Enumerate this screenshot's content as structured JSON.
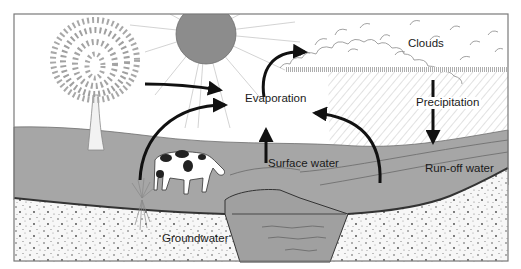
{
  "diagram": {
    "labels": {
      "clouds": "Clouds",
      "evaporation": "Evaporation",
      "precipitation": "Precipitation",
      "surface_water": "Surface water",
      "runoff_water": "Run-off water",
      "groundwater": "Groundwater"
    },
    "elements": [
      "sun",
      "tree",
      "cow",
      "grass",
      "clouds",
      "rain",
      "lake",
      "ground",
      "arrows"
    ],
    "colors": {
      "land": "#a6a6a6",
      "sun": "#8c8c8c",
      "soil": "#f7f7f7",
      "arrow": "#111111",
      "frame": "#7a7a7a",
      "text": "#1a1a1a"
    }
  }
}
